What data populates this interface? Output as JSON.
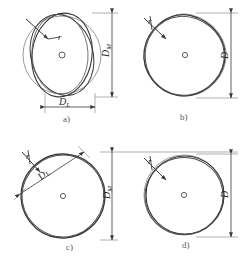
{
  "figure": {
    "stroke_color": "#3a3a3a",
    "thin_stroke_color": "#8a8a8a",
    "background": "#ffffff",
    "panels": [
      {
        "id": "a",
        "letter": "a)",
        "center_mark": "o",
        "radius_label": "r",
        "dimensions": [
          {
            "name": "D_M",
            "symbol": "D",
            "subscript": "M",
            "orientation": "vertical"
          },
          {
            "name": "D_L",
            "symbol": "D",
            "subscript": "L",
            "orientation": "horizontal"
          }
        ]
      },
      {
        "id": "b",
        "letter": "b)",
        "center_mark": "o",
        "radius_label": "r",
        "dimensions": [
          {
            "name": "D",
            "symbol": "D",
            "subscript": "",
            "orientation": "vertical"
          }
        ]
      },
      {
        "id": "c",
        "letter": "c)",
        "center_mark": "o",
        "radius_label": "r",
        "dimensions": [
          {
            "name": "D_M",
            "symbol": "D",
            "subscript": "M",
            "orientation": "vertical"
          },
          {
            "name": "D_L",
            "symbol": "D",
            "subscript": "L",
            "orientation": "diagonal"
          }
        ]
      },
      {
        "id": "d",
        "letter": "d)",
        "center_mark": "o",
        "radius_label": "r",
        "dimensions": [
          {
            "name": "D",
            "symbol": "D",
            "subscript": "",
            "orientation": "vertical"
          }
        ]
      }
    ]
  }
}
